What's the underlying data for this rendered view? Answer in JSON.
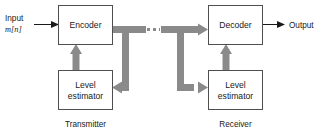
{
  "diagram": {
    "colors": {
      "background": "#ffffff",
      "box_border": "#4f4f4f",
      "box_fill": "#ffffff",
      "thick_signal_path": "#8a8a8a",
      "thin_signal_path": "#1a1a1a",
      "text": "#1a1a1a"
    },
    "blocks": {
      "encoder": {
        "label": "Encoder"
      },
      "decoder": {
        "label": "Decoder"
      },
      "tx_level_estimator": {
        "line1": "Level",
        "line2": "estimator"
      },
      "rx_level_estimator": {
        "line1": "Level",
        "line2": "estimator"
      }
    },
    "io": {
      "input_line1": "Input",
      "input_line2": "m[n]",
      "output": "Output"
    },
    "sections": {
      "transmitter": "Transmitter",
      "receiver": "Receiver"
    }
  }
}
